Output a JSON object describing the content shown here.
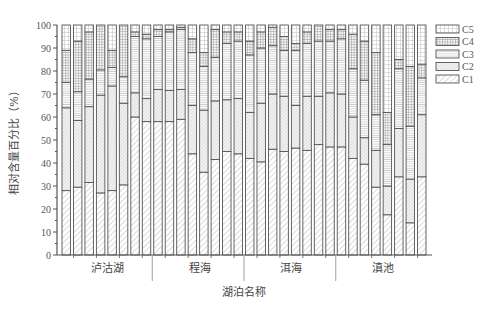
{
  "chart_data": {
    "type": "bar",
    "stacked": true,
    "normalized_percent": true,
    "title": "",
    "xlabel": "湖泊名称",
    "ylabel": "相对含量百分比（%）",
    "ylim": [
      0,
      100
    ],
    "yticks": [
      0,
      10,
      20,
      30,
      40,
      50,
      60,
      70,
      80,
      90,
      100
    ],
    "grid": false,
    "legend_position": "upper right, outside plot",
    "groups": [
      {
        "name": "泸沽湖",
        "bar_count": 8
      },
      {
        "name": "程海",
        "bar_count": 8
      },
      {
        "name": "洱海",
        "bar_count": 8
      },
      {
        "name": "滇池",
        "bar_count": 8
      }
    ],
    "categories": [
      "1",
      "2",
      "3",
      "4",
      "5",
      "6",
      "7",
      "8",
      "9",
      "10",
      "11",
      "12",
      "13",
      "14",
      "15",
      "16",
      "17",
      "18",
      "19",
      "20",
      "21",
      "22",
      "23",
      "24",
      "25",
      "26",
      "27",
      "28",
      "29",
      "30",
      "31",
      "32"
    ],
    "series": [
      {
        "name": "C1",
        "pattern": "diagonal-hatch-light",
        "values": [
          28,
          29.5,
          31.5,
          27,
          28,
          30.5,
          60,
          58,
          58,
          58,
          59,
          44,
          36,
          41.5,
          45,
          44,
          42,
          40.5,
          46,
          45,
          46.5,
          45.5,
          48,
          47,
          47,
          42,
          39.5,
          29.5,
          17.5,
          34,
          14,
          34
        ]
      },
      {
        "name": "C2",
        "pattern": "diagonal-hatch-dense",
        "values": [
          36,
          29,
          33,
          42.5,
          45.5,
          35.5,
          10.5,
          10,
          14,
          13.5,
          13,
          21,
          27,
          25.5,
          22.5,
          24,
          20,
          25.5,
          24,
          24,
          18.5,
          23.5,
          21,
          23.5,
          23,
          18,
          11.5,
          16,
          12.5,
          21,
          19,
          27
        ]
      },
      {
        "name": "C3",
        "pattern": "horizontal-lines",
        "values": [
          11,
          12.5,
          12,
          11,
          8,
          11.5,
          24.5,
          26,
          23,
          25.5,
          26,
          23,
          19,
          19,
          24.5,
          25,
          25,
          24,
          21,
          20,
          24,
          23,
          24,
          22.5,
          24,
          21,
          25,
          15.5,
          18,
          26,
          23,
          16
        ]
      },
      {
        "name": "C4",
        "pattern": "grid-dense",
        "values": [
          14,
          22,
          20.5,
          19.5,
          7.5,
          22.5,
          2,
          2,
          3,
          1,
          1,
          6,
          6,
          12,
          5,
          4,
          6,
          7,
          8,
          6,
          3,
          5,
          7,
          5,
          4,
          15,
          17,
          27,
          14,
          4,
          26,
          6
        ]
      },
      {
        "name": "C5",
        "pattern": "grid-sparse",
        "values": [
          11,
          7,
          3,
          0,
          11,
          0,
          3,
          4,
          2,
          2,
          1,
          6,
          12,
          2,
          3,
          3,
          7,
          3,
          1,
          5,
          8,
          3,
          0,
          2,
          2,
          4,
          7,
          12,
          38,
          15,
          18,
          17
        ]
      }
    ],
    "legend": [
      "C5",
      "C4",
      "C3",
      "C2",
      "C1"
    ]
  },
  "axis": {
    "y_tick_labels": [
      "0",
      "10",
      "20",
      "30",
      "40",
      "50",
      "60",
      "70",
      "80",
      "90",
      "100"
    ],
    "x_group_labels": [
      "泸沽湖",
      "程海",
      "洱海",
      "滇池"
    ],
    "x_title": "湖泊名称",
    "y_title": "相对含量百分比（%）"
  },
  "legend": {
    "items": [
      {
        "label": "C5",
        "pattern": "grid-sparse"
      },
      {
        "label": "C4",
        "pattern": "grid-dense"
      },
      {
        "label": "C3",
        "pattern": "horizontal-lines"
      },
      {
        "label": "C2",
        "pattern": "diagonal-hatch-dense"
      },
      {
        "label": "C1",
        "pattern": "diagonal-hatch-light"
      }
    ]
  },
  "colors": {
    "axis": "#555555",
    "bar_outline": "#555555",
    "pattern_stroke": "#9a9a9a",
    "background": "#ffffff"
  }
}
